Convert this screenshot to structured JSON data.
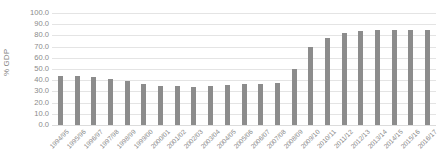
{
  "chart_data": {
    "type": "bar",
    "title": "",
    "xlabel": "",
    "ylabel": "% GDP",
    "ylim": [
      0,
      100
    ],
    "ytick_labels": [
      "100.0",
      "90.0",
      "80.0",
      "70.0",
      "60.0",
      "50.0",
      "40.0",
      "30.0",
      "20.0",
      "10.0",
      "0.0"
    ],
    "ytick_values": [
      100,
      90,
      80,
      70,
      60,
      50,
      40,
      30,
      20,
      10,
      0
    ],
    "grid": true,
    "legend": "none",
    "bar_color": "#8c8c8c",
    "gridline_color": "#e4e4e4",
    "categories": [
      "1994/95",
      "1995/96",
      "1996/97",
      "1997/98",
      "1998/99",
      "1999/00",
      "2000/01",
      "2001/02",
      "2002/03",
      "2003/04",
      "2004/05",
      "2005/06",
      "2006/07",
      "2007/08",
      "2008/09",
      "2009/10",
      "2010/11",
      "2011/12",
      "2012/13",
      "2013/14",
      "2014/15",
      "2015/16",
      "2016/17"
    ],
    "values": [
      44.0,
      44.0,
      42.5,
      41.0,
      39.0,
      36.5,
      35.0,
      34.5,
      34.0,
      35.0,
      36.0,
      37.0,
      37.0,
      37.5,
      50.0,
      70.0,
      78.0,
      82.0,
      83.5,
      85.0,
      85.0,
      85.0,
      85.0
    ]
  }
}
